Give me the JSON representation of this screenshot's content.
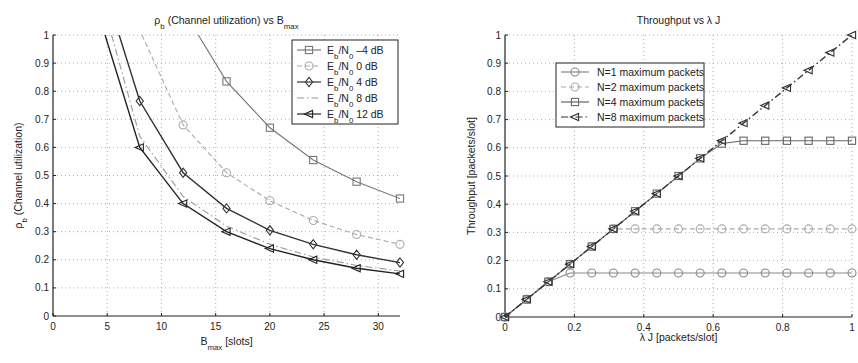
{
  "chart_data": [
    {
      "type": "line",
      "title": "ρb (Channel utilization) vs Bmax",
      "title_parts": {
        "rho": "ρ",
        "rho_sub": "b",
        "mid": " (Channel utilization) vs B",
        "b_sub": "max"
      },
      "xlabel": "Bmax [slots]",
      "xlabel_parts": {
        "main": "B",
        "sub": "max",
        "rest": " [slots]"
      },
      "ylabel": "ρb (Channel utilization)",
      "ylabel_parts": {
        "main": "ρ",
        "sub": "b",
        "rest": " (Channel utilization)"
      },
      "xlim": [
        0,
        32
      ],
      "ylim": [
        0,
        1
      ],
      "xticks": [
        0,
        5,
        10,
        15,
        20,
        25,
        30
      ],
      "yticks": [
        0,
        0.1,
        0.2,
        0.3,
        0.4,
        0.5,
        0.6,
        0.7,
        0.8,
        0.9,
        1
      ],
      "grid": true,
      "legend_position": "upper right",
      "series": [
        {
          "name": "Eb/N0 -4 dB",
          "label_main": "E",
          "label_sub1": "b",
          "label_mid": "/N",
          "label_sub2": "0",
          "label_rest": " –4 dB",
          "marker": "square",
          "style": "solid",
          "color": "#777777",
          "x": [
            13.4,
            16,
            20,
            24,
            28,
            32
          ],
          "y": [
            1.0,
            0.835,
            0.67,
            0.555,
            0.478,
            0.418
          ],
          "marker_from": 1
        },
        {
          "name": "Eb/N0 0 dB",
          "label_main": "E",
          "label_sub1": "b",
          "label_mid": "/N",
          "label_sub2": "0",
          "label_rest": " 0 dB",
          "marker": "circle",
          "style": "dash",
          "color": "#aaaaaa",
          "x": [
            8.2,
            12,
            16,
            20,
            24,
            28,
            32
          ],
          "y": [
            1.0,
            0.68,
            0.51,
            0.41,
            0.34,
            0.29,
            0.255
          ],
          "marker_from": 1
        },
        {
          "name": "Eb/N0 4 dB",
          "label_main": "E",
          "label_sub1": "b",
          "label_mid": "/N",
          "label_sub2": "0",
          "label_rest": " 4 dB",
          "marker": "diamond",
          "style": "solid",
          "color": "#333333",
          "x": [
            6.1,
            8,
            12,
            16,
            20,
            24,
            28,
            32
          ],
          "y": [
            1.0,
            0.765,
            0.51,
            0.383,
            0.305,
            0.255,
            0.218,
            0.19
          ],
          "marker_from": 1
        },
        {
          "name": "Eb/N0 8 dB",
          "label_main": "E",
          "label_sub1": "b",
          "label_mid": "/N",
          "label_sub2": "0",
          "label_rest": " 8 dB",
          "marker": "none",
          "style": "dashdot",
          "color": "#999999",
          "x": [
            5.4,
            8,
            12,
            16,
            20,
            24,
            28,
            32
          ],
          "y": [
            1.0,
            0.64,
            0.425,
            0.32,
            0.255,
            0.21,
            0.18,
            0.16
          ],
          "marker_from": 99
        },
        {
          "name": "Eb/N0 12 dB",
          "label_main": "E",
          "label_sub1": "b",
          "label_mid": "/N",
          "label_sub2": "0",
          "label_rest": " 12 dB",
          "marker": "triangle-left",
          "style": "solid",
          "color": "#222222",
          "x": [
            4.8,
            8,
            12,
            16,
            20,
            24,
            28,
            32
          ],
          "y": [
            1.0,
            0.6,
            0.4,
            0.3,
            0.24,
            0.2,
            0.17,
            0.15
          ],
          "marker_from": 1
        }
      ]
    },
    {
      "type": "line",
      "title": "Throughput vs λ J",
      "xlabel": "λ J [packets/slot]",
      "ylabel": "Throughput [packets/slot]",
      "xlim": [
        0,
        1
      ],
      "ylim": [
        0,
        1
      ],
      "xticks": [
        0,
        0.2,
        0.4,
        0.6,
        0.8,
        1
      ],
      "yticks": [
        0,
        0.1,
        0.2,
        0.3,
        0.4,
        0.5,
        0.6,
        0.7,
        0.8,
        0.9,
        1
      ],
      "grid": true,
      "legend_position": "upper left (inset)",
      "series": [
        {
          "name": "N=1 maximum packets",
          "marker": "circle",
          "style": "solid",
          "color": "#888888",
          "x": [
            0,
            0.0625,
            0.125,
            0.1875,
            0.25,
            0.3125,
            0.375,
            0.4375,
            0.5,
            0.5625,
            0.625,
            0.6875,
            0.75,
            0.8125,
            0.875,
            0.9375,
            1.0
          ],
          "y": [
            0,
            0.0625,
            0.125,
            0.156,
            0.156,
            0.156,
            0.156,
            0.156,
            0.156,
            0.156,
            0.156,
            0.156,
            0.156,
            0.156,
            0.156,
            0.156,
            0.156
          ]
        },
        {
          "name": "N=2 maximum packets",
          "marker": "circle",
          "style": "dash",
          "color": "#aaaaaa",
          "x": [
            0,
            0.0625,
            0.125,
            0.1875,
            0.25,
            0.3125,
            0.375,
            0.4375,
            0.5,
            0.5625,
            0.625,
            0.6875,
            0.75,
            0.8125,
            0.875,
            0.9375,
            1.0
          ],
          "y": [
            0,
            0.0625,
            0.125,
            0.1875,
            0.25,
            0.3125,
            0.3125,
            0.3125,
            0.3125,
            0.3125,
            0.3125,
            0.3125,
            0.3125,
            0.3125,
            0.3125,
            0.3125,
            0.3125
          ]
        },
        {
          "name": "N=4 maximum packets",
          "marker": "square",
          "style": "solid",
          "color": "#666666",
          "x": [
            0,
            0.0625,
            0.125,
            0.1875,
            0.25,
            0.3125,
            0.375,
            0.4375,
            0.5,
            0.5625,
            0.625,
            0.6875,
            0.75,
            0.8125,
            0.875,
            0.9375,
            1.0
          ],
          "y": [
            0,
            0.0625,
            0.125,
            0.1875,
            0.25,
            0.3125,
            0.375,
            0.4375,
            0.5,
            0.5625,
            0.615,
            0.625,
            0.625,
            0.625,
            0.625,
            0.625,
            0.625
          ]
        },
        {
          "name": "N=8 maximum packets",
          "marker": "triangle-left",
          "style": "dashdot",
          "color": "#333333",
          "x": [
            0,
            0.0625,
            0.125,
            0.1875,
            0.25,
            0.3125,
            0.375,
            0.4375,
            0.5,
            0.5625,
            0.625,
            0.6875,
            0.75,
            0.8125,
            0.875,
            0.9375,
            1.0
          ],
          "y": [
            0,
            0.0625,
            0.125,
            0.1875,
            0.25,
            0.3125,
            0.375,
            0.4375,
            0.5,
            0.5625,
            0.625,
            0.6875,
            0.75,
            0.8125,
            0.875,
            0.9375,
            1.0
          ]
        }
      ]
    }
  ],
  "layout": {
    "left": {
      "x0": 53,
      "x1": 400,
      "y0": 316,
      "y1": 35
    },
    "right": {
      "x0": 505,
      "x1": 852,
      "y0": 317,
      "y1": 35
    }
  }
}
